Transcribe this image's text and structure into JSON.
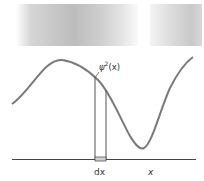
{
  "figure": {
    "curve_label_base": "ψ",
    "curve_label_sup": "2",
    "curve_label_arg": "(x)",
    "strip_label": "dx",
    "axis_label": "x",
    "colors": {
      "curve": "#707070",
      "axis": "#333333",
      "strip_fill": "#d8d8d8",
      "band": "#c8c8c8"
    }
  }
}
